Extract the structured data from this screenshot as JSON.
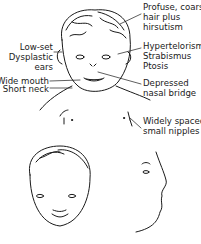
{
  "figure": {
    "labels": {
      "hair": [
        "Profuse, coarse",
        "hair plus",
        "hirsutism"
      ],
      "eyes": [
        "Hypertelorism",
        "Strabismus",
        "Ptosis"
      ],
      "ears": [
        "Low-set",
        "Dysplastic",
        "ears"
      ],
      "nose": [
        "Depressed",
        "nasal bridge"
      ],
      "mouth": "Wide mouth",
      "neck": "Short neck",
      "nipples": [
        "Widely spaced,",
        "small nipples"
      ]
    },
    "views": [
      "upper-body-front",
      "face-front",
      "face-profile"
    ]
  }
}
